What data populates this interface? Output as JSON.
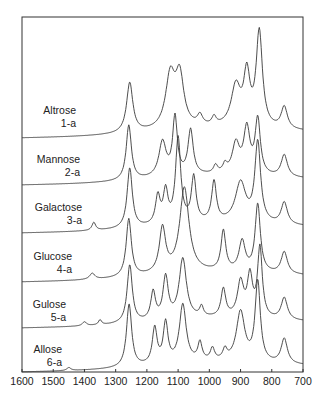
{
  "chart_data": {
    "type": "line",
    "title": "",
    "xlabel": "",
    "ylabel": "",
    "x_unit": "wavenumber (cm-1)",
    "xlim": [
      1600,
      700
    ],
    "x_reversed": true,
    "x_ticks": [
      1600,
      1500,
      1400,
      1300,
      1200,
      1100,
      1000,
      900,
      800,
      700
    ],
    "grid": false,
    "legend": "inline labels at left of each trace",
    "stacked_offset": true,
    "series": [
      {
        "name": "Altrose",
        "id": "1-a",
        "baseline_y": 133,
        "peaks": [
          [
            1255,
            50,
            12
          ],
          [
            1125,
            52,
            18
          ],
          [
            1095,
            50,
            16
          ],
          [
            1030,
            10,
            10
          ],
          [
            985,
            8,
            8
          ],
          [
            915,
            40,
            18
          ],
          [
            880,
            50,
            12
          ],
          [
            840,
            95,
            12
          ],
          [
            760,
            22,
            12
          ]
        ]
      },
      {
        "name": "Mannose",
        "id": "2-a",
        "baseline_y": 180,
        "peaks": [
          [
            1258,
            55,
            10
          ],
          [
            1150,
            35,
            14
          ],
          [
            1110,
            58,
            9
          ],
          [
            1060,
            45,
            10
          ],
          [
            980,
            8,
            8
          ],
          [
            950,
            8,
            8
          ],
          [
            915,
            30,
            14
          ],
          [
            880,
            45,
            12
          ],
          [
            845,
            55,
            10
          ],
          [
            760,
            22,
            12
          ]
        ]
      },
      {
        "name": "Galactose",
        "id": "3-a",
        "baseline_y": 228,
        "peaks": [
          [
            1370,
            8,
            7
          ],
          [
            1255,
            60,
            10
          ],
          [
            1165,
            28,
            9
          ],
          [
            1140,
            32,
            9
          ],
          [
            1100,
            85,
            10
          ],
          [
            1050,
            45,
            9
          ],
          [
            985,
            40,
            9
          ],
          [
            900,
            40,
            20
          ],
          [
            845,
            80,
            11
          ],
          [
            760,
            22,
            12
          ]
        ]
      },
      {
        "name": "Glucose",
        "id": "4-a",
        "baseline_y": 277,
        "peaks": [
          [
            1375,
            6,
            10
          ],
          [
            1258,
            58,
            10
          ],
          [
            1150,
            45,
            12
          ],
          [
            1080,
            85,
            18
          ],
          [
            955,
            40,
            9
          ],
          [
            895,
            30,
            12
          ],
          [
            845,
            68,
            10
          ],
          [
            760,
            22,
            12
          ]
        ]
      },
      {
        "name": "Gulose",
        "id": "5-a",
        "baseline_y": 323,
        "peaks": [
          [
            1400,
            4,
            8
          ],
          [
            1350,
            5,
            6
          ],
          [
            1255,
            58,
            10
          ],
          [
            1180,
            28,
            9
          ],
          [
            1140,
            42,
            10
          ],
          [
            1085,
            60,
            14
          ],
          [
            1025,
            10,
            7
          ],
          [
            955,
            28,
            9
          ],
          [
            900,
            35,
            12
          ],
          [
            870,
            40,
            10
          ],
          [
            838,
            70,
            9
          ],
          [
            760,
            22,
            12
          ]
        ]
      },
      {
        "name": "Allose",
        "id": "6-a",
        "baseline_y": 367,
        "peaks": [
          [
            1450,
            3,
            8
          ],
          [
            1257,
            63,
            10
          ],
          [
            1175,
            36,
            9
          ],
          [
            1140,
            40,
            9
          ],
          [
            1085,
            58,
            13
          ],
          [
            1030,
            18,
            8
          ],
          [
            990,
            12,
            8
          ],
          [
            950,
            10,
            8
          ],
          [
            900,
            50,
            16
          ],
          [
            845,
            80,
            10
          ],
          [
            760,
            25,
            12
          ]
        ]
      }
    ]
  },
  "labels": [
    {
      "name": "Altrose",
      "id": "1-a"
    },
    {
      "name": "Mannose",
      "id": "2-a"
    },
    {
      "name": "Galactose",
      "id": "3-a"
    },
    {
      "name": "Glucose",
      "id": "4-a"
    },
    {
      "name": "Gulose",
      "id": "5-a"
    },
    {
      "name": "Allose",
      "id": "6-a"
    }
  ]
}
